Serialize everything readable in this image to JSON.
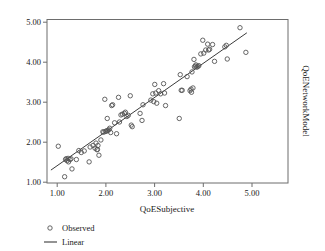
{
  "chart_data": {
    "type": "scatter",
    "title": "",
    "xlabel": "QoESubjective",
    "ylabel": "QoENetworkModel",
    "xlim": [
      0.92,
      5.84
    ],
    "ylim": [
      0.9,
      5.08
    ],
    "grid": false,
    "xticks": [
      1.0,
      2.0,
      3.0,
      4.0,
      5.0
    ],
    "xtick_labels": [
      "1.00",
      "2.00",
      "3.00",
      "4.00",
      "5.00"
    ],
    "yticks": [
      1.0,
      2.0,
      3.0,
      4.0,
      5.0
    ],
    "ytick_labels": [
      "1.00",
      "2.00",
      "3.00",
      "4.00",
      "5.00"
    ],
    "legend_position": "below-left",
    "legend": [
      {
        "label": "Observed",
        "marker": "open-circle"
      },
      {
        "label": "Linear",
        "marker": "line"
      }
    ],
    "series": [
      {
        "name": "Observed",
        "marker": "open-circle",
        "color": "#555555",
        "points": [
          [
            1.15,
            1.84
          ],
          [
            1.28,
            1.06
          ],
          [
            1.3,
            1.5
          ],
          [
            1.31,
            1.52
          ],
          [
            1.33,
            1.47
          ],
          [
            1.35,
            1.53
          ],
          [
            1.36,
            1.44
          ],
          [
            1.39,
            1.5
          ],
          [
            1.41,
            1.52
          ],
          [
            1.43,
            1.26
          ],
          [
            1.52,
            1.5
          ],
          [
            1.57,
            1.73
          ],
          [
            1.62,
            1.68
          ],
          [
            1.68,
            1.72
          ],
          [
            1.78,
            1.44
          ],
          [
            1.8,
            1.82
          ],
          [
            1.86,
            1.86
          ],
          [
            1.9,
            1.79
          ],
          [
            1.92,
            1.92
          ],
          [
            1.94,
            1.75
          ],
          [
            1.95,
            1.76
          ],
          [
            1.96,
            1.86
          ],
          [
            1.98,
            1.61
          ],
          [
            2.02,
            2.0
          ],
          [
            2.06,
            2.21
          ],
          [
            2.08,
            2.2
          ],
          [
            2.1,
            3.04
          ],
          [
            2.12,
            2.22
          ],
          [
            2.13,
            2.23
          ],
          [
            2.15,
            2.55
          ],
          [
            2.16,
            2.24
          ],
          [
            2.18,
            2.26
          ],
          [
            2.2,
            2.3
          ],
          [
            2.22,
            2.19
          ],
          [
            2.24,
            2.88
          ],
          [
            2.26,
            2.9
          ],
          [
            2.3,
            2.44
          ],
          [
            2.34,
            2.16
          ],
          [
            2.38,
            3.09
          ],
          [
            2.4,
            2.46
          ],
          [
            2.43,
            2.64
          ],
          [
            2.46,
            2.66
          ],
          [
            2.5,
            2.68
          ],
          [
            2.52,
            2.71
          ],
          [
            2.55,
            2.6
          ],
          [
            2.58,
            2.63
          ],
          [
            2.62,
            3.13
          ],
          [
            2.64,
            2.38
          ],
          [
            2.66,
            2.34
          ],
          [
            2.82,
            2.68
          ],
          [
            2.86,
            2.5
          ],
          [
            2.88,
            2.9
          ],
          [
            3.04,
            3.02
          ],
          [
            3.08,
            3.18
          ],
          [
            3.1,
            2.98
          ],
          [
            3.12,
            3.42
          ],
          [
            3.14,
            3.2
          ],
          [
            3.16,
            2.94
          ],
          [
            3.2,
            3.26
          ],
          [
            3.24,
            3.18
          ],
          [
            3.3,
            3.44
          ],
          [
            3.32,
            3.2
          ],
          [
            3.34,
            2.88
          ],
          [
            3.62,
            2.55
          ],
          [
            3.64,
            3.67
          ],
          [
            3.66,
            3.27
          ],
          [
            3.68,
            3.27
          ],
          [
            3.78,
            3.62
          ],
          [
            3.84,
            3.26
          ],
          [
            3.86,
            3.3
          ],
          [
            3.87,
            3.22
          ],
          [
            3.88,
            3.74
          ],
          [
            3.9,
            3.33
          ],
          [
            3.92,
            4.06
          ],
          [
            3.93,
            3.87
          ],
          [
            3.95,
            3.89
          ],
          [
            3.96,
            3.92
          ],
          [
            3.98,
            3.86
          ],
          [
            4.0,
            3.88
          ],
          [
            4.02,
            3.9
          ],
          [
            4.06,
            4.2
          ],
          [
            4.1,
            4.55
          ],
          [
            4.12,
            4.22
          ],
          [
            4.16,
            4.3
          ],
          [
            4.2,
            4.45
          ],
          [
            4.22,
            4.3
          ],
          [
            4.24,
            4.32
          ],
          [
            4.3,
            4.44
          ],
          [
            4.34,
            4.01
          ],
          [
            4.55,
            4.38
          ],
          [
            4.58,
            4.42
          ],
          [
            4.6,
            4.07
          ],
          [
            4.86,
            4.87
          ],
          [
            4.98,
            4.24
          ]
        ]
      }
    ],
    "fit_line": {
      "name": "Linear",
      "color": "#3b3b3b",
      "x_start": 1.0,
      "y_start": 1.23,
      "x_end": 5.0,
      "y_end": 4.74
    }
  }
}
